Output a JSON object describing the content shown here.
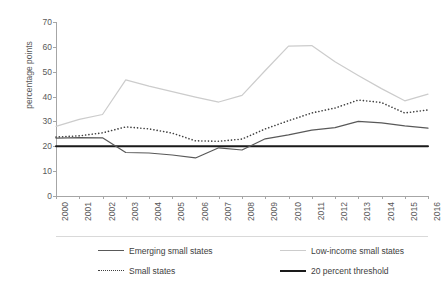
{
  "chart_data": {
    "type": "line",
    "title": "",
    "xlabel": "",
    "ylabel": "percentage points",
    "categories": [
      "2000",
      "2001",
      "2002",
      "2003",
      "2004",
      "2005",
      "2006",
      "2007",
      "2008",
      "2009",
      "2010",
      "2011",
      "2012",
      "2013",
      "2014",
      "2015",
      "2016"
    ],
    "ylim": [
      0,
      70
    ],
    "yticks": [
      0,
      10,
      20,
      30,
      40,
      50,
      60,
      70
    ],
    "grid": false,
    "legend_position": "bottom",
    "series": [
      {
        "name": "Emerging small states",
        "style": "solid",
        "color": "#595959",
        "values": [
          23.3,
          23.5,
          23.4,
          17.5,
          17.3,
          16.5,
          15.3,
          19.4,
          18.5,
          23.0,
          24.6,
          26.5,
          27.5,
          30.0,
          29.4,
          28.2,
          27.3
        ]
      },
      {
        "name": "Low-income small states",
        "style": "solid",
        "color": "#cccccc",
        "values": [
          28.0,
          30.8,
          32.8,
          46.7,
          44.2,
          42.0,
          39.8,
          37.8,
          40.5,
          50.5,
          60.3,
          60.5,
          54.0,
          48.5,
          43.2,
          38.3,
          41.0
        ]
      },
      {
        "name": "Small states",
        "style": "dotted",
        "color": "#404040",
        "values": [
          23.7,
          24.2,
          25.4,
          27.8,
          27.0,
          25.3,
          22.2,
          22.0,
          22.9,
          27.0,
          30.3,
          33.4,
          35.4,
          38.6,
          37.6,
          33.4,
          34.6
        ]
      },
      {
        "name": "20 percent threshold",
        "style": "solid",
        "color": "#1a1a1a",
        "values": [
          20,
          20,
          20,
          20,
          20,
          20,
          20,
          20,
          20,
          20,
          20,
          20,
          20,
          20,
          20,
          20,
          20
        ]
      }
    ]
  }
}
